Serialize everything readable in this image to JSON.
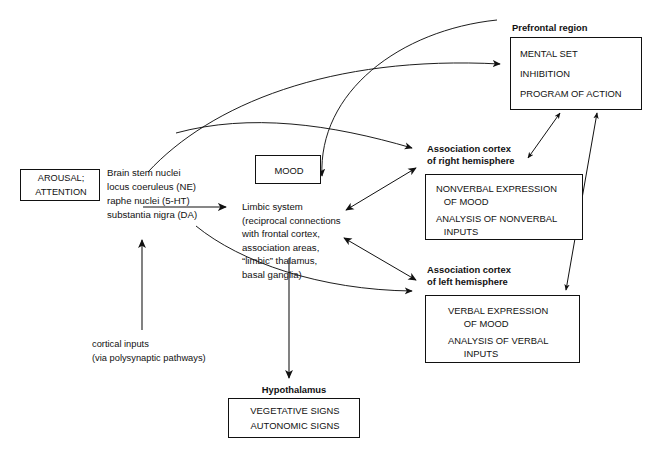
{
  "diagram": {
    "type": "flow-diagram",
    "colors": {
      "stroke": "#111111",
      "background": "#ffffff",
      "text": "#111111"
    },
    "nodes": {
      "arousal": {
        "label": "AROUSAL;\nATTENTION",
        "line1": "AROUSAL;",
        "line2": "ATTENTION",
        "boxed": true
      },
      "brainstem": {
        "lines": [
          "Brain stem nuclei",
          "locus coeruleus (NE)",
          "raphe nuclei (5-HT)",
          "substantia nigra (DA)"
        ],
        "boxed": false
      },
      "mood": {
        "label": "MOOD",
        "boxed": true
      },
      "limbic": {
        "lines": [
          "Limbic system",
          "(reciprocal connections",
          "with frontal cortex,",
          "association areas,",
          "“limbic” thalamus,",
          "basal ganglia)"
        ],
        "boxed": false
      },
      "cortical_inputs": {
        "lines": [
          "cortical inputs",
          "(via polysynaptic pathways)"
        ],
        "boxed": false
      },
      "prefrontal": {
        "heading": "Prefrontal region",
        "items": [
          "MENTAL SET",
          "INHIBITION",
          "PROGRAM OF ACTION"
        ],
        "boxed": true
      },
      "right_hemisphere": {
        "heading_line1": "Association cortex",
        "heading_line2": "of right hemisphere",
        "items": [
          "NONVERBAL EXPRESSION",
          "   OF MOOD",
          "ANALYSIS OF NONVERBAL",
          "   INPUTS"
        ],
        "boxed": true
      },
      "left_hemisphere": {
        "heading_line1": "Association cortex",
        "heading_line2": "of left hemisphere",
        "items": [
          "VERBAL EXPRESSION",
          "   OF MOOD",
          "ANALYSIS OF VERBAL",
          "   INPUTS"
        ],
        "boxed": true
      },
      "hypothalamus": {
        "heading": "Hypothalamus",
        "items": [
          "VEGETATIVE SIGNS",
          "AUTONOMIC SIGNS"
        ],
        "boxed": true
      }
    },
    "edges": [
      {
        "from": "brainstem",
        "to": "limbic",
        "style": "straight",
        "heads": "single"
      },
      {
        "from": "brainstem",
        "to": "prefrontal",
        "style": "curved",
        "heads": "single"
      },
      {
        "from": "brainstem",
        "to": "right_hemisphere",
        "style": "curved",
        "heads": "single"
      },
      {
        "from": "brainstem",
        "to": "left_hemisphere",
        "style": "curved",
        "heads": "single"
      },
      {
        "from": "cortical_inputs",
        "to": "brainstem",
        "style": "straight",
        "heads": "single"
      },
      {
        "from": "prefrontal",
        "to": "limbic",
        "style": "curved",
        "heads": "single"
      },
      {
        "from": "limbic",
        "to": "right_hemisphere",
        "style": "straight",
        "heads": "double"
      },
      {
        "from": "limbic",
        "to": "left_hemisphere",
        "style": "straight",
        "heads": "double"
      },
      {
        "from": "limbic",
        "to": "hypothalamus",
        "style": "straight",
        "heads": "single"
      },
      {
        "from": "prefrontal",
        "to": "right_hemisphere",
        "style": "straight",
        "heads": "double"
      },
      {
        "from": "prefrontal",
        "to": "left_hemisphere",
        "style": "straight",
        "heads": "double"
      }
    ]
  }
}
